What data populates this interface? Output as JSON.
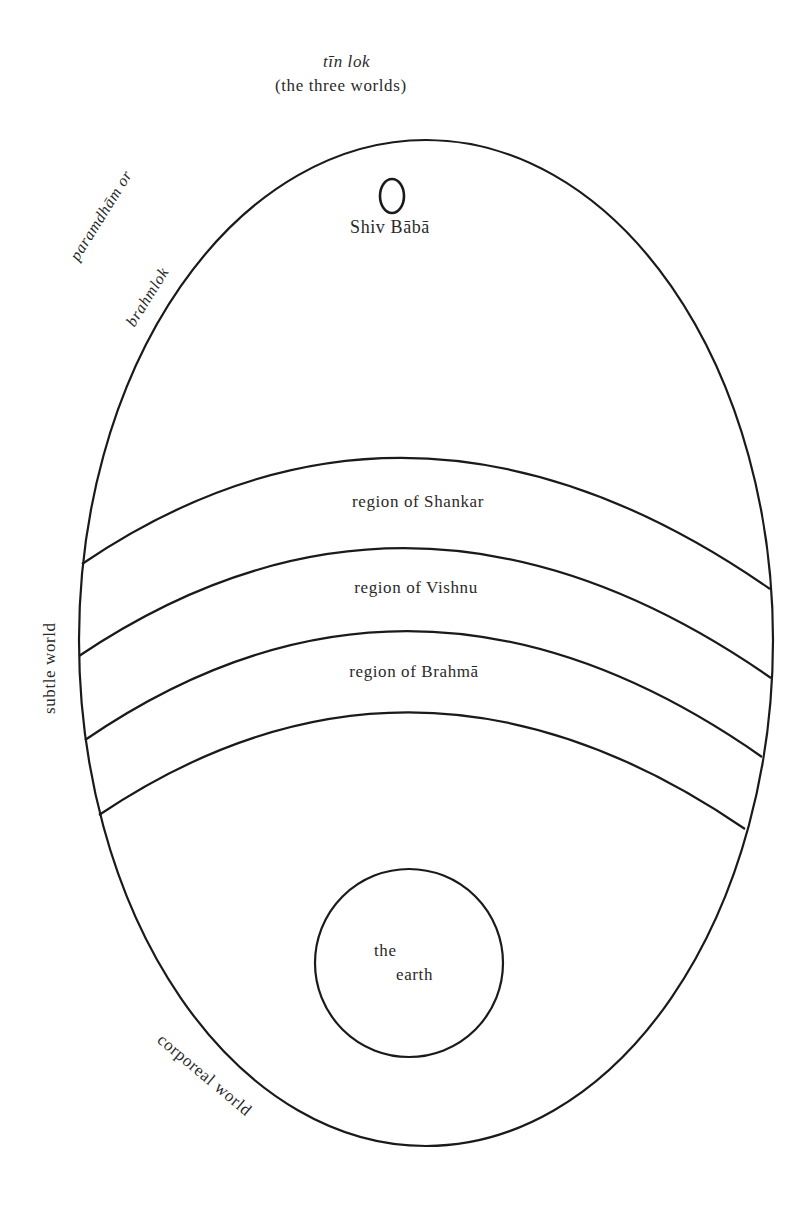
{
  "title": {
    "term": "tīn lok",
    "gloss": "(the three worlds)"
  },
  "top_region": {
    "deity_label": "Shiv Bābā",
    "side_label_line1": "paramdhām or",
    "side_label_line2": "brahmlok"
  },
  "subtle_world": {
    "side_label": "subtle world",
    "regions": [
      {
        "label": "region of Shankar"
      },
      {
        "label": "region of Vishnu"
      },
      {
        "label": "region of Brahmā"
      }
    ]
  },
  "corporeal_world": {
    "side_label": "corporeal world",
    "earth_line1": "the",
    "earth_line2": "earth"
  },
  "colors": {
    "stroke": "#1a1a1a",
    "text": "#2a2a2a",
    "background": "#ffffff"
  }
}
